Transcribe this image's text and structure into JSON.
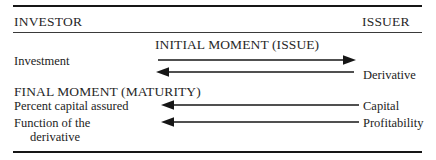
{
  "diagram": {
    "columns": {
      "left_header": "INVESTOR",
      "right_header": "ISSUER"
    },
    "phases": [
      {
        "name": "INITIAL MOMENT (ISSUE)"
      },
      {
        "name": "FINAL MOMENT (MATURITY)"
      }
    ],
    "flows": [
      {
        "phase": "INITIAL MOMENT (ISSUE)",
        "left_label": "Investment",
        "right_label": "",
        "direction": "left-to-right",
        "arrow_icon": "arrow-right-icon"
      },
      {
        "phase": "INITIAL MOMENT (ISSUE)",
        "left_label": "",
        "right_label": "Derivative",
        "direction": "right-to-left",
        "arrow_icon": "arrow-left-icon"
      },
      {
        "phase": "FINAL MOMENT (MATURITY)",
        "left_label": "Percent capital assured",
        "right_label": "Capital",
        "direction": "right-to-left",
        "arrow_icon": "arrow-left-icon"
      },
      {
        "phase": "FINAL MOMENT (MATURITY)",
        "left_label": "Function of the",
        "left_label_continued": "derivative",
        "right_label": "Profitability",
        "direction": "right-to-left",
        "arrow_icon": "arrow-left-icon"
      }
    ],
    "colors": {
      "ink": "#161616",
      "text": "#272727",
      "background": "#ffffff"
    }
  }
}
